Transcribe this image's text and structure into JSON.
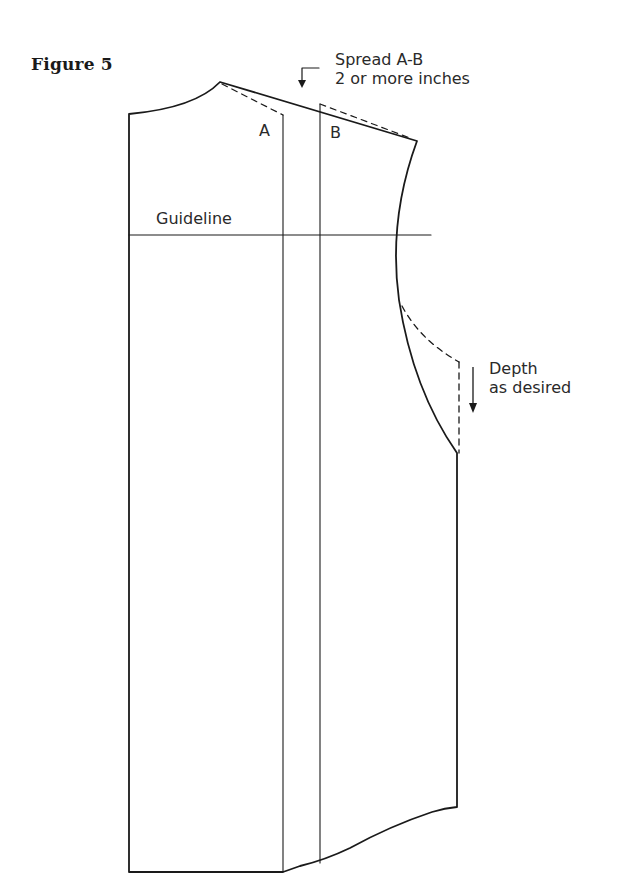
{
  "figure": {
    "title": "Figure 5"
  },
  "labels": {
    "a": "A",
    "b": "B",
    "guideline": "Guideline"
  },
  "annotations": {
    "spread": {
      "line1": "Spread A-B",
      "line2": "2 or more inches"
    },
    "depth": {
      "line1": "Depth",
      "line2": "as desired"
    }
  },
  "colors": {
    "line": "#1a1a1a",
    "text": "#2a2a2a",
    "background": "#ffffff"
  }
}
